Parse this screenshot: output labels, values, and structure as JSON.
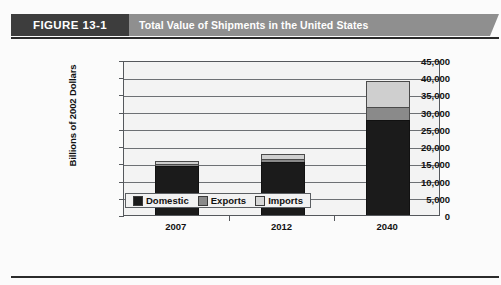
{
  "figure": {
    "tag": "FIGURE 13-1",
    "title": "Total Value of Shipments in the United States"
  },
  "colors": {
    "banner_tag_bg": "#3d3d3d",
    "banner_title_bg": "#8f8f8f",
    "domestic": "#1b1b1b",
    "exports": "#8a8a8a",
    "imports": "#cfcfcf",
    "plot_bg": "#f3f3f3",
    "axis": "#55585c"
  },
  "chart_data": {
    "type": "bar",
    "subtype": "stacked",
    "title": "Total Value of Shipments in the United States",
    "xlabel": "",
    "ylabel": "Billions of 2002 Dollars",
    "categories": [
      "2007",
      "2012",
      "2040"
    ],
    "series": [
      {
        "name": "Domestic",
        "values": [
          14200,
          15400,
          27600
        ]
      },
      {
        "name": "Exports",
        "values": [
          700,
          800,
          3800
        ]
      },
      {
        "name": "Imports",
        "values": [
          800,
          1500,
          7600
        ]
      }
    ],
    "totals": [
      15700,
      17700,
      39000
    ],
    "ylim": [
      0,
      45000
    ],
    "ytick_step": 5000,
    "ytick_labels": [
      "45,000",
      "40,000",
      "35,000",
      "30,000",
      "25,000",
      "20,000",
      "15,000",
      "10,000",
      "5,000",
      "0"
    ],
    "ytick_values": [
      45000,
      40000,
      35000,
      30000,
      25000,
      20000,
      15000,
      10000,
      5000,
      0
    ],
    "grid": true,
    "legend_position": "bottom",
    "legend": [
      "Domestic",
      "Exports",
      "Imports"
    ]
  }
}
